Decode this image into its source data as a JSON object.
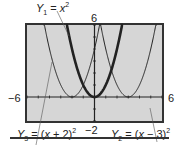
{
  "chart_data": {
    "type": "line",
    "title": "",
    "xlabel": "",
    "ylabel": "",
    "xlim": [
      -6,
      6
    ],
    "ylim": [
      -2,
      6
    ],
    "window_labels": {
      "xmin": "−6",
      "xmax": "6",
      "ymin": "−2",
      "ymax": "6"
    },
    "grid": false,
    "series": [
      {
        "name": "Y1 = x^2",
        "expr": "x^2",
        "weight": "bold"
      },
      {
        "name": "Y2 = (x − 3)^2",
        "expr": "(x-3)^2",
        "weight": "thin"
      },
      {
        "name": "Y3 = (x + 2)^2",
        "expr": "(x+2)^2",
        "weight": "thin"
      }
    ],
    "annotations": [
      {
        "text": "Y1 = x^2",
        "position": "top-left"
      },
      {
        "text": "Y3 = (x + 2)^2",
        "position": "bottom-left"
      },
      {
        "text": "Y2 = (x − 3)^2",
        "position": "bottom-right"
      }
    ]
  },
  "labels": {
    "y1_sym": "Y",
    "y1_sub": "1",
    "y1_eq": " = ",
    "y1_var": "x",
    "y1_sup": "2",
    "y2_sym": "Y",
    "y2_sub": "2",
    "y2_eq": " = (",
    "y2_var": "x",
    "y2_rest": " − 3)",
    "y2_sup": "2",
    "y3_sym": "Y",
    "y3_sub": "3",
    "y3_eq": " = (",
    "y3_var": "x",
    "y3_rest": " + 2)",
    "y3_sup": "2",
    "xmin": "−6",
    "xmax": "6",
    "ymin": "−2",
    "ymax": "6"
  },
  "colors": {
    "screen_bg": "#d6d6d6",
    "frame": "#333333",
    "curve": "#222222"
  }
}
